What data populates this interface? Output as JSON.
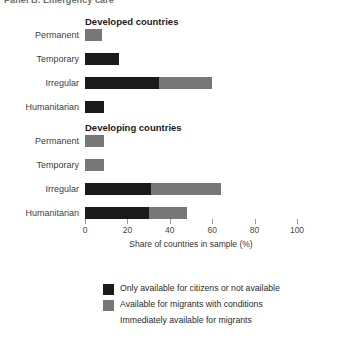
{
  "panel": {
    "title": "Panel B. Emergency care"
  },
  "axis": {
    "title": "Share of countries in sample (%)",
    "ticks": [
      0,
      20,
      40,
      60,
      80,
      100
    ],
    "min": 0,
    "max": 100
  },
  "legend": {
    "items": [
      {
        "label": "Only available for citizens or not available",
        "color": "#1a1a1a",
        "key": "s0"
      },
      {
        "label": "Available for migrants with conditions",
        "color": "#777777",
        "key": "s1"
      },
      {
        "label": "Immediately available for migrants",
        "color": "#ffffff",
        "key": "s2"
      }
    ]
  },
  "chart_data": {
    "type": "bar",
    "orientation": "horizontal",
    "stacked": true,
    "title": "Panel B. Emergency care",
    "xlabel": "Share of countries in sample (%)",
    "ylabel": "",
    "xlim": [
      0,
      100
    ],
    "grid": false,
    "legend_position": "bottom",
    "categories": [
      "Permanent",
      "Temporary",
      "Irregular",
      "Humanitarian"
    ],
    "series": [
      {
        "name": "Only available for citizens or not available",
        "color": "#1a1a1a"
      },
      {
        "name": "Available for migrants with conditions",
        "color": "#777777"
      },
      {
        "name": "Immediately available for migrants",
        "color": "#ffffff"
      }
    ],
    "groups": [
      {
        "name": "Developed countries",
        "rows": [
          {
            "category": "Permanent",
            "values": [
              0,
              8,
              92
            ]
          },
          {
            "category": "Temporary",
            "values": [
              16,
              0,
              84
            ]
          },
          {
            "category": "Irregular",
            "values": [
              35,
              25,
              40
            ]
          },
          {
            "category": "Humanitarian",
            "values": [
              9,
              0,
              91
            ]
          }
        ]
      },
      {
        "name": "Developing countries",
        "rows": [
          {
            "category": "Permanent",
            "values": [
              0,
              9,
              91
            ]
          },
          {
            "category": "Temporary",
            "values": [
              0,
              9,
              91
            ]
          },
          {
            "category": "Irregular",
            "values": [
              31,
              33,
              36
            ]
          },
          {
            "category": "Humanitarian",
            "values": [
              30,
              18,
              52
            ]
          }
        ]
      }
    ]
  }
}
